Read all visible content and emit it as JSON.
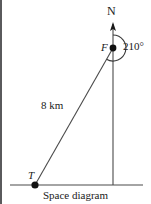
{
  "figure": {
    "caption": "Space diagram",
    "labels": {
      "north": "N",
      "point_f": "F",
      "point_t": "T",
      "bearing": "210°",
      "distance": "8 km"
    },
    "colors": {
      "ink": "#1a1a1a",
      "line": "#4a4a4a",
      "border": "#5a5a5c",
      "background": "#ffffff"
    },
    "geometry": {
      "point_f": [
        113,
        48
      ],
      "point_t": [
        35,
        185
      ],
      "north_arrow_tip": [
        113,
        24
      ],
      "baseline_y": 185,
      "baseline_x_start": 10,
      "baseline_x_end": 143,
      "arc_radius": 13,
      "arc_sweep_degrees": 210
    }
  }
}
